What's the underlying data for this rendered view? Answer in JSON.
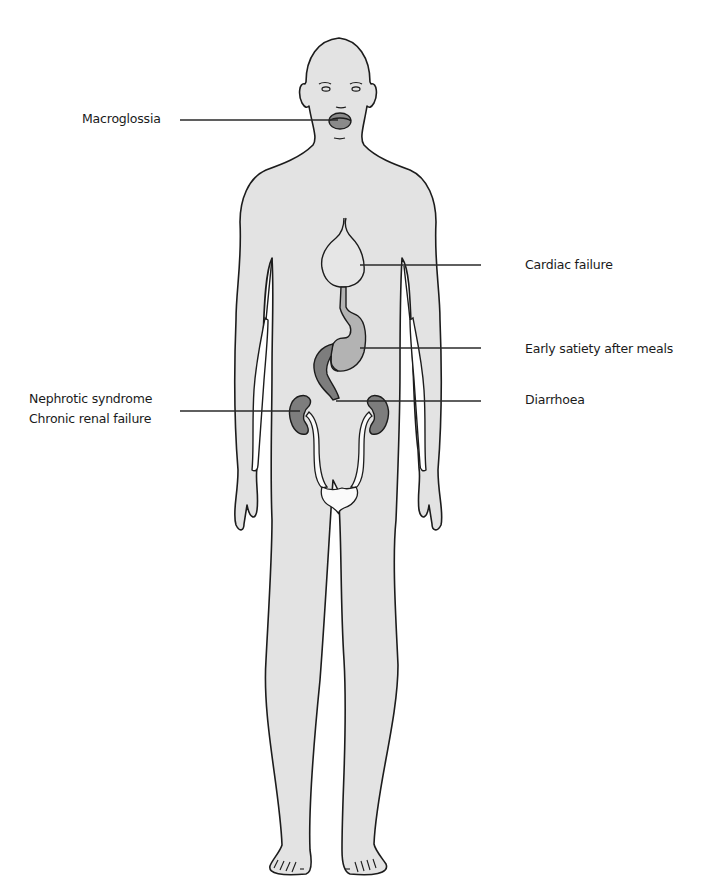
{
  "figure": {
    "type": "anatomical-diagram",
    "colors": {
      "body_fill": "#e3e3e3",
      "outline": "#1c1c1c",
      "heart_fill": "#e6e6e6",
      "stomach_fill": "#b3b3b3",
      "bowel_fill": "#7d7d7d",
      "kidney_fill": "#7d7d7d",
      "urinary_tract_fill": "#fafafa",
      "leader_line": "#2a2a2a",
      "text": "#1a1a1a"
    }
  },
  "labels": {
    "macroglossia": "Macroglossia",
    "cardiac_failure": "Cardiac failure",
    "early_satiety": "Early satiety after meals",
    "diarrhoea": "Diarrhoea",
    "nephrotic_syndrome": "Nephrotic syndrome",
    "chronic_renal_failure": "Chronic renal failure"
  }
}
